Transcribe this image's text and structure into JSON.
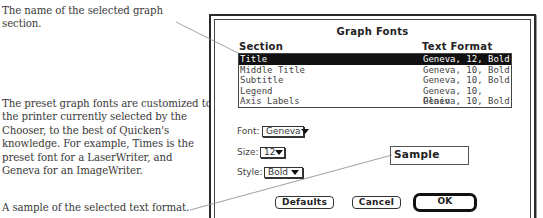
{
  "annotations": [
    "The name of the selected graph section.",
    "The preset graph fonts are customized to the printer currently selected by the Chooser, to the best of Quicken's knowledge. For example, Times is the preset font for a LaserWriter, and Geneva for an ImageWriter.",
    "A sample of the selected text format."
  ],
  "dialog": {
    "title": "Graph Fonts",
    "columns": {
      "section": "Section",
      "format": "Text Format"
    },
    "rows": [
      {
        "section": "Title",
        "format": "Geneva, 12, Bold",
        "selected": true
      },
      {
        "section": "Middle Title",
        "format": "Geneva, 10, Bold"
      },
      {
        "section": "Subtitle",
        "format": "Geneva, 10, Bold"
      },
      {
        "section": "Legend",
        "format": "Geneva, 10, Plain"
      },
      {
        "section": "Axis Labels",
        "format": "Geneva, 10, Bold"
      }
    ],
    "font": {
      "label": "Font:",
      "value": "Geneva"
    },
    "size": {
      "label": "Size:",
      "value": "12"
    },
    "style": {
      "label": "Style:",
      "value": "Bold"
    },
    "sample": "Sample",
    "buttons": {
      "defaults": "Defaults",
      "cancel": "Cancel",
      "ok": "OK"
    }
  }
}
